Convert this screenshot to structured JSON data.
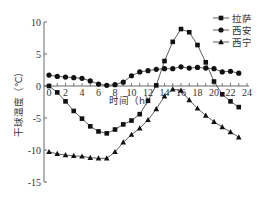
{
  "chart_data": {
    "type": "line",
    "title": "",
    "xlabel": "时间（h）",
    "ylabel": "干球温度（℃）",
    "x": [
      0,
      1,
      2,
      3,
      4,
      5,
      6,
      7,
      8,
      9,
      10,
      11,
      12,
      13,
      14,
      15,
      16,
      17,
      18,
      19,
      20,
      21,
      22,
      23
    ],
    "xticks": [
      "0",
      "2",
      "4",
      "6",
      "8",
      "10",
      "12",
      "14",
      "16",
      "18",
      "20",
      "22",
      "24"
    ],
    "yticks": [
      "10",
      "5",
      "0",
      "-5",
      "-10",
      "-15"
    ],
    "xlim": [
      0,
      24
    ],
    "ylim": [
      -15,
      10
    ],
    "grid": false,
    "legend_position": "upper right",
    "series": [
      {
        "name": "拉萨",
        "marker": "square",
        "values": [
          0.0,
          -1.0,
          -2.4,
          -3.9,
          -5.1,
          -6.3,
          -7.1,
          -7.4,
          -6.8,
          -6.0,
          -5.4,
          -4.4,
          -2.3,
          0.1,
          3.9,
          6.9,
          8.9,
          8.4,
          6.4,
          3.7,
          0.7,
          -1.3,
          -2.4,
          -3.3
        ]
      },
      {
        "name": "西安",
        "marker": "circle",
        "values": [
          1.7,
          1.5,
          1.4,
          1.3,
          1.2,
          0.8,
          0.3,
          0.1,
          0.2,
          0.6,
          1.6,
          2.2,
          2.4,
          2.6,
          2.7,
          2.7,
          3.0,
          2.8,
          2.9,
          2.8,
          2.7,
          2.2,
          2.3,
          2.0
        ]
      },
      {
        "name": "西宁",
        "marker": "triangle",
        "values": [
          -10.3,
          -10.6,
          -10.8,
          -10.9,
          -11.0,
          -11.2,
          -11.3,
          -11.3,
          -10.3,
          -8.8,
          -7.6,
          -6.6,
          -5.3,
          -3.6,
          -1.6,
          -0.5,
          -0.7,
          -2.2,
          -3.5,
          -4.6,
          -5.6,
          -6.4,
          -7.2,
          -8.0
        ]
      }
    ]
  }
}
